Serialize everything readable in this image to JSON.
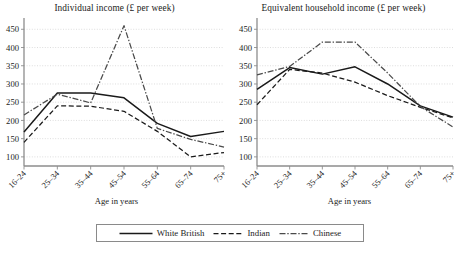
{
  "figure": {
    "axis_label": "Age in years",
    "legend": {
      "border_color": "#8a8a8a",
      "entries": [
        {
          "label": "White British",
          "style": "solid",
          "color": "#1a1a1a"
        },
        {
          "label": "Indian",
          "style": "dashed",
          "color": "#1a1a1a"
        },
        {
          "label": "Chinese",
          "style": "dash-dot",
          "color": "#4a4a4a"
        }
      ]
    },
    "colors": {
      "axis": "#8d8d8d",
      "grid": "#cfcfcf",
      "text": "#1b1b1b",
      "white_british": "#1a1a1a",
      "indian": "#1a1a1a",
      "chinese": "#4a4a4a"
    }
  },
  "chart_data": [
    {
      "id": "individual-income",
      "type": "line",
      "title": "Individual income (£ per week)",
      "xlabel": "Age in years",
      "ylabel": "",
      "categories": [
        "16–24",
        "25–34",
        "35–44",
        "45–54",
        "55–64",
        "65–74",
        "75+"
      ],
      "ylim": [
        75,
        470
      ],
      "yticks": [
        100,
        150,
        200,
        250,
        300,
        350,
        400,
        450
      ],
      "ytick_labels": [
        "100",
        "150",
        "200",
        "250",
        "300",
        "350",
        "400",
        "450"
      ],
      "grid": true,
      "legend_position": "bottom-outside",
      "series": [
        {
          "name": "White British",
          "style": "solid",
          "values": [
            168,
            275,
            275,
            262,
            192,
            156,
            170
          ]
        },
        {
          "name": "Indian",
          "style": "dashed",
          "values": [
            140,
            240,
            239,
            225,
            170,
            100,
            112
          ]
        },
        {
          "name": "Chinese",
          "style": "dash-dot",
          "values": [
            215,
            272,
            248,
            460,
            178,
            148,
            127
          ]
        }
      ]
    },
    {
      "id": "equivalent-household-income",
      "type": "line",
      "title": "Equivalent household income (£ per week)",
      "xlabel": "Age in years",
      "ylabel": "",
      "categories": [
        "16–24",
        "25–34",
        "35–44",
        "45–54",
        "55–64",
        "65–74",
        "75+"
      ],
      "ylim": [
        75,
        470
      ],
      "yticks": [
        100,
        150,
        200,
        250,
        300,
        350,
        400,
        450
      ],
      "ytick_labels": [
        "100",
        "150",
        "200",
        "250",
        "300",
        "350",
        "400",
        "450"
      ],
      "grid": true,
      "legend_position": "bottom-outside",
      "series": [
        {
          "name": "White British",
          "style": "solid",
          "values": [
            285,
            345,
            327,
            347,
            300,
            240,
            209
          ]
        },
        {
          "name": "Indian",
          "style": "dashed",
          "values": [
            243,
            340,
            330,
            305,
            268,
            236,
            207
          ]
        },
        {
          "name": "Chinese",
          "style": "dash-dot",
          "values": [
            325,
            348,
            415,
            415,
            330,
            238,
            182
          ]
        }
      ]
    }
  ]
}
